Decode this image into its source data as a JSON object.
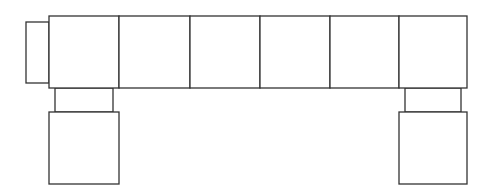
{
  "diagram": {
    "stroke_color": "#333333",
    "fill_color": "#ffffff",
    "left_tab": {
      "x": 26,
      "y": 22,
      "w": 23,
      "h": 61
    },
    "main_row": {
      "x": 49,
      "y": 16,
      "h": 72,
      "cell_edges": [
        49,
        119,
        190,
        260,
        330,
        399,
        467
      ]
    },
    "legs": [
      {
        "side": "left",
        "connector": {
          "x": 55,
          "y": 88,
          "w": 58,
          "h": 24
        },
        "box": {
          "x": 49,
          "y": 112,
          "w": 70,
          "h": 72
        }
      },
      {
        "side": "right",
        "connector": {
          "x": 405,
          "y": 88,
          "w": 56,
          "h": 24
        },
        "box": {
          "x": 399,
          "y": 112,
          "w": 68,
          "h": 72
        }
      }
    ]
  }
}
